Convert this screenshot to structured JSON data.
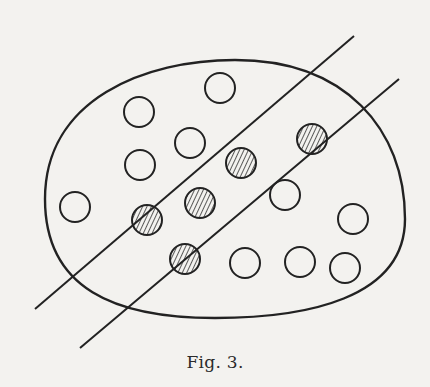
{
  "figure": {
    "caption": "Fig. 3.",
    "colors": {
      "background": "#f3f2ef",
      "ink": "#222222",
      "hatch": "#333333"
    },
    "boundary": {
      "shape": "closed-curve",
      "cx": 225,
      "cy": 189,
      "rx": 180,
      "ry": 129
    },
    "lines": [
      {
        "x1": 35,
        "y1": 309,
        "x2": 354,
        "y2": 36
      },
      {
        "x1": 80,
        "y1": 348,
        "x2": 399,
        "y2": 79
      }
    ],
    "circles": [
      {
        "cx": 139,
        "cy": 112,
        "r": 15,
        "filled": false
      },
      {
        "cx": 220,
        "cy": 88,
        "r": 15,
        "filled": false
      },
      {
        "cx": 140,
        "cy": 165,
        "r": 15,
        "filled": false
      },
      {
        "cx": 190,
        "cy": 143,
        "r": 15,
        "filled": false
      },
      {
        "cx": 75,
        "cy": 207,
        "r": 15,
        "filled": false
      },
      {
        "cx": 285,
        "cy": 195,
        "r": 15,
        "filled": false
      },
      {
        "cx": 353,
        "cy": 219,
        "r": 15,
        "filled": false
      },
      {
        "cx": 245,
        "cy": 263,
        "r": 15,
        "filled": false
      },
      {
        "cx": 300,
        "cy": 262,
        "r": 15,
        "filled": false
      },
      {
        "cx": 345,
        "cy": 268,
        "r": 15,
        "filled": false
      },
      {
        "cx": 241,
        "cy": 163,
        "r": 15,
        "filled": true
      },
      {
        "cx": 200,
        "cy": 203,
        "r": 15,
        "filled": true
      },
      {
        "cx": 312,
        "cy": 139,
        "r": 15,
        "filled": true
      },
      {
        "cx": 147,
        "cy": 220,
        "r": 15,
        "filled": true
      },
      {
        "cx": 185,
        "cy": 259,
        "r": 15,
        "filled": true
      }
    ]
  }
}
